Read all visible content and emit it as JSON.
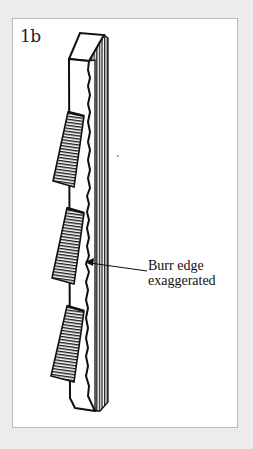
{
  "figure": {
    "label": "1b",
    "callout": {
      "line1": "Burr edge",
      "line2": "exaggerated"
    },
    "colors": {
      "background": "#ececec",
      "panel": "#ffffff",
      "panel_border": "#b9b9b9",
      "ink": "#111111"
    }
  }
}
